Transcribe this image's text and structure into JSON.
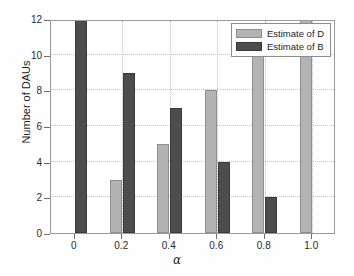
{
  "chart_data": {
    "type": "bar",
    "title": "",
    "xlabel": "α",
    "ylabel": "Number of DAUs",
    "categories": [
      "0",
      "0.2",
      "0.4",
      "0.6",
      "0.8",
      "1.0"
    ],
    "series": [
      {
        "name": "Estimate of D",
        "color": "#b3b3b3",
        "values": [
          0,
          3,
          5,
          8,
          10,
          12
        ]
      },
      {
        "name": "Estimate of B",
        "color": "#4d4d4d",
        "values": [
          12,
          9,
          7,
          4,
          2,
          0
        ]
      }
    ],
    "ylim": [
      0,
      12
    ],
    "yticks": [
      0,
      2,
      4,
      6,
      8,
      10,
      12
    ],
    "ytick_labels": [
      "0",
      "2",
      "4",
      "6",
      "8",
      "10",
      "12"
    ],
    "xtick_labels": [
      "0",
      "0.2",
      "0.4",
      "0.6",
      "0.8",
      "1.0"
    ],
    "grid": true,
    "grid_style": "dotted",
    "legend_position": "top-right",
    "axis_color": "#9a9a9a",
    "background": "#ffffff"
  },
  "legend": {
    "entries": [
      {
        "label": "Estimate of D"
      },
      {
        "label": "Estimate of B"
      }
    ]
  }
}
